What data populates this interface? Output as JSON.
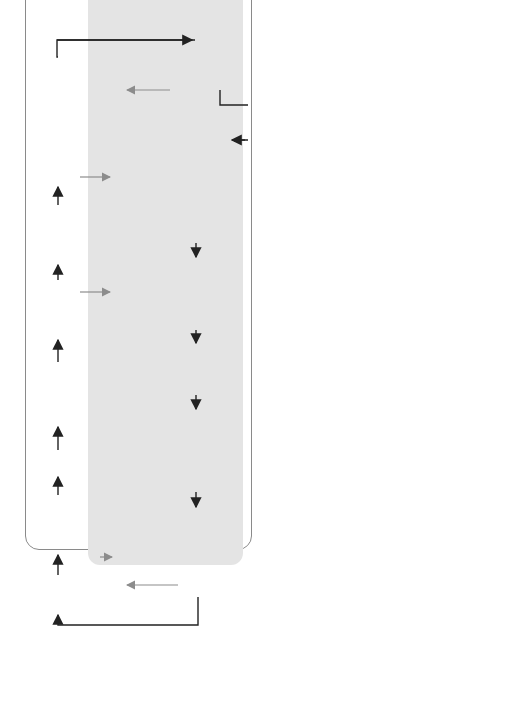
{
  "diagram": {
    "orientation": "rotated 90deg counter-clockwise",
    "colors": {
      "node_fill": "#cfcfcf",
      "dark_node_fill": "#4a4a4a",
      "firewall_panel": "#e4e4e4",
      "drop_pill": "#a6a6a6",
      "line": "#222222",
      "grey_line": "#8c8c8c"
    },
    "legend": {
      "firepower_engine": "Firepower Engine",
      "firewall_engine": "Firewall Engine"
    },
    "firepower": {
      "identity_policy": "Identity Policy",
      "acl_l7": "ACL (L7) App, URL",
      "qos_classify": "QoS Classify",
      "host_user_discovery": "Host and User Discovery",
      "file_type_control": "File Type Control",
      "malware_analysis": "Malware Analysis",
      "back_orifice": "Back Orifice, Portscan, Rate-Based, Sensitive Data",
      "snort_rule": "Snort Rule",
      "transport_l2l4": {
        "title": "Transport and Network Layer Preprocessor",
        "detail": "(L2-L4 Decode)"
      },
      "sec_intl_ip": "Sec Intl IP Add",
      "transport_defrag": {
        "title": "Transport and Network Layer Preprocessor",
        "detail": "(IP Defragment, TCP/UDP Stream)"
      },
      "application_discovery": "Application Discovery",
      "app_layer_preprocessor": {
        "title": "Application Layer Preprocessor",
        "detail": "(DCE/RPC, DNS, FTP/Telnet, HTTP, Sun RPC, SIP, IMAP, POP, SMTP, SSH, SSL)"
      },
      "sec_intl_url_dns": "Sec Intl. URL, DNS",
      "drop": "Drop",
      "labels": {
        "blacklisted": "Blacklisted",
        "restricted_type": "Restricted Type",
        "malware": "Malware",
        "intrusion": "Intrusion",
        "black_listed_1": "Black- listed",
        "black_listed_2": "Black- listed"
      }
    },
    "data_acquisition": "Data Acquisition",
    "firewall": {
      "existing_conn": "Existing Conn.",
      "vpn_decrypt": "VPN Decrypt",
      "un_nat": "UN-NAT/ Egress Int.",
      "prefilter_policy": "Prefilter Policy",
      "acl_l3l4": "ACL L3-L4",
      "flow_update": "Flow Update",
      "alg_check": "ALG Check",
      "nat_ip_header": "NAT IP Header",
      "qos_enforce": "QoS Enforce",
      "vpn_encrypt": "VPN Encrypt",
      "l3_route": "L3 Route",
      "l2_add": "L2 Add.",
      "drop": "Drop",
      "block": "Block",
      "labels": {
        "yes_existing": "Yes",
        "no_existing": "No",
        "fast_path": "Fast Path",
        "fast_path_prefilter": "Fast Path",
        "trust": "Trust",
        "no_l3": "No",
        "no_l2": "No",
        "yes_l2": "Yes"
      }
    },
    "io": {
      "packet_in": "Packet",
      "ingress_interface": "Ingress Interface",
      "egress_interface": "Egress Interface",
      "packet_out": "Packet"
    }
  }
}
